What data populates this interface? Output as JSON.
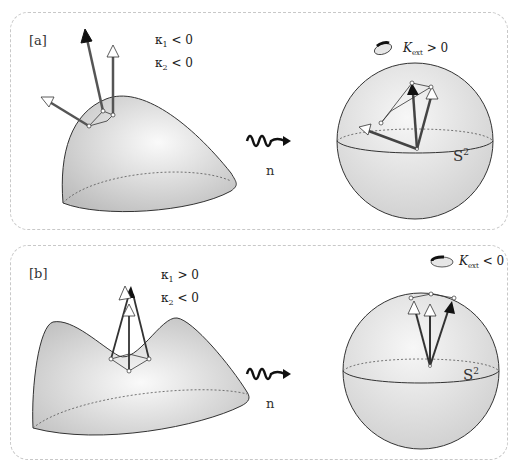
{
  "figure": {
    "panels": [
      {
        "id": "a",
        "label": "[a]",
        "curvature": {
          "k1": {
            "symbol": "κ",
            "sub": "1",
            "relation": "< 0"
          },
          "k2": {
            "symbol": "κ",
            "sub": "2",
            "relation": "< 0"
          }
        },
        "surface_type": "dome (elliptic point)",
        "map_label": "n",
        "sphere_label": {
          "base": "S",
          "sup": "2"
        },
        "gaussian_curvature": {
          "symbol": "K",
          "sub": "ext",
          "relation": "> 0"
        },
        "orientation": "preserved"
      },
      {
        "id": "b",
        "label": "[b]",
        "curvature": {
          "k1": {
            "symbol": "κ",
            "sub": "1",
            "relation": "> 0"
          },
          "k2": {
            "symbol": "κ",
            "sub": "2",
            "relation": "< 0"
          }
        },
        "surface_type": "saddle (hyperbolic point)",
        "map_label": "n",
        "sphere_label": {
          "base": "S",
          "sup": "2"
        },
        "gaussian_curvature": {
          "symbol": "K",
          "sub": "ext",
          "relation": "< 0"
        },
        "orientation": "reversed"
      }
    ],
    "colors": {
      "surface_fill": "#d6d6d6",
      "surface_highlight": "#f8f8f8",
      "stroke": "#333333",
      "arrow_dark": "#111111",
      "arrow_light": "#ffffff",
      "panel_border": "#c8c8c8"
    }
  }
}
